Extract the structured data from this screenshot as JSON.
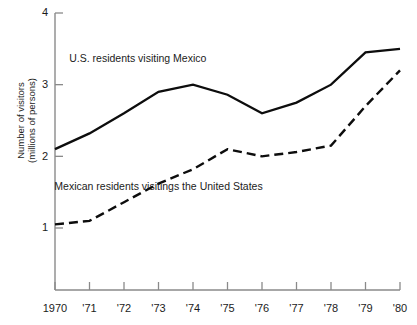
{
  "chart_data": {
    "type": "line",
    "title": "",
    "xlabel": "",
    "ylabel": "Number of visitors\n(millions of persons)",
    "ylabel_line1": "Number of visitors",
    "ylabel_line2": "(millions of persons)",
    "x": [
      1970,
      1971,
      1972,
      1973,
      1974,
      1975,
      1976,
      1977,
      1978,
      1979,
      1980
    ],
    "categories": [
      "1970",
      "'71",
      "'72",
      "'73",
      "'74",
      "'75",
      "'76",
      "'77",
      "'78",
      "'79",
      "'80"
    ],
    "xtick_labels": [
      "1970",
      "'71",
      "'72",
      "'73",
      "'74",
      "'75",
      "'76",
      "'77",
      "'78",
      "'79",
      "'80"
    ],
    "ytick_labels": [
      "1",
      "2",
      "3",
      "4"
    ],
    "ytick_values": [
      1,
      2,
      3,
      4
    ],
    "ylim": [
      0.42,
      4.0
    ],
    "xlim": [
      1970,
      1980
    ],
    "grid": false,
    "legend_position": "inline-annotations",
    "series": [
      {
        "name": "U.S. residents visiting Mexico",
        "style": "solid",
        "color": "#0d0d0d",
        "values": [
          2.1,
          2.32,
          2.6,
          2.9,
          3.0,
          2.86,
          2.6,
          2.75,
          3.0,
          3.45,
          3.5
        ]
      },
      {
        "name": "Mexican residents visitings the United States",
        "style": "dashed",
        "color": "#0d0d0d",
        "values": [
          1.05,
          1.1,
          1.36,
          1.62,
          1.82,
          2.1,
          2.0,
          2.06,
          2.15,
          2.7,
          3.2
        ]
      }
    ],
    "annotations": [
      {
        "text": "U.S. residents visiting Mexico",
        "x": 1972.4,
        "y": 3.32
      },
      {
        "text": "Mexican residents visitings the United States",
        "x": 1973.0,
        "y": 1.53
      }
    ]
  },
  "axes": {
    "y_axis_name": "y-axis",
    "x_axis_name": "x-axis"
  }
}
